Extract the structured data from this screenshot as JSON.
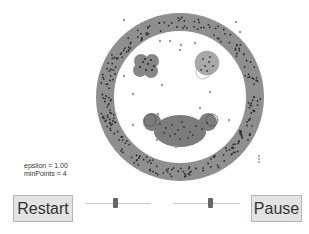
{
  "params": {
    "epsilon_label": "epsilon = 1.00",
    "minpoints_label": "minPoints = 4"
  },
  "buttons": {
    "restart_label": "Restart",
    "pause_label": "Pause"
  },
  "sliders": {
    "epsilon": {
      "position_pct": 46
    },
    "minpoints": {
      "position_pct": 55
    }
  },
  "visualization": {
    "ring": {
      "cx": 180,
      "cy": 97,
      "outer_r": 84,
      "inner_r": 66
    },
    "clusters": [
      {
        "name": "left-eye",
        "cx": 146,
        "cy": 65,
        "r": 12
      },
      {
        "name": "right-eye",
        "cx": 207,
        "cy": 64,
        "r": 12
      },
      {
        "name": "mouth",
        "cx": 180,
        "cy": 130,
        "r": 22
      }
    ],
    "colors": {
      "ring": "#8c8c8c",
      "cluster_dark": "#7a7a7a",
      "cluster_light": "#a7a7a7",
      "point": "#2a2a2a",
      "noise": "#9a9a9a"
    }
  }
}
